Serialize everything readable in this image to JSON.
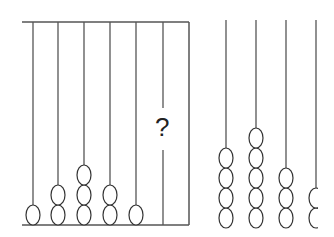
{
  "left_abacus": {
    "frame": {
      "top_y": 22,
      "bottom_y": 225,
      "left_x": 22,
      "right_x": 189
    },
    "rods": [
      {
        "x": 33,
        "beads": 1
      },
      {
        "x": 58,
        "beads": 2
      },
      {
        "x": 84,
        "beads": 3
      },
      {
        "x": 110,
        "beads": 2
      },
      {
        "x": 136,
        "beads": 1
      },
      {
        "x": 163,
        "beads": null,
        "label": "?"
      }
    ]
  },
  "right_abacus": {
    "rod_top_y": 20,
    "bead_bottom_y": 228,
    "clip_x": 318,
    "rods": [
      {
        "x": 226,
        "beads": 4
      },
      {
        "x": 256,
        "beads": 5
      },
      {
        "x": 286,
        "beads": 3
      },
      {
        "x": 316,
        "beads": 2
      }
    ]
  },
  "question_mark": "?",
  "colors": {
    "line": "#555555",
    "bead": "#333333"
  }
}
